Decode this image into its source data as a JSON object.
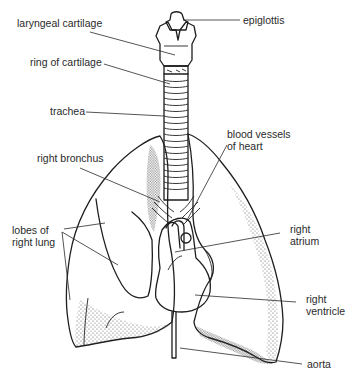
{
  "diagram": {
    "labels": {
      "epiglottis": "epiglottis",
      "laryngeal_cartilage": "laryngeal cartilage",
      "ring_of_cartilage": "ring of cartilage",
      "trachea": "trachea",
      "blood_vessels": "blood vessels\nof heart",
      "right_bronchus": "right bronchus",
      "lobes": "lobes of\nright lung",
      "right_atrium": "right\natrium",
      "right_ventricle": "right\nventricle",
      "aorta": "aorta"
    },
    "colors": {
      "line": "#1e1e1e",
      "stipple": "#3a3a3a",
      "background": "#ffffff",
      "text": "#2a2a2a"
    }
  }
}
